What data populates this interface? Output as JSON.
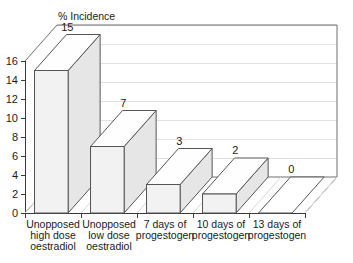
{
  "chart_data": {
    "type": "bar",
    "title": "% Incidence",
    "xlabel": "",
    "ylabel": "% Incidence",
    "ylim": [
      0,
      16
    ],
    "ytick_labels": [
      "0",
      "2",
      "4",
      "6",
      "8",
      "10",
      "12",
      "14",
      "16"
    ],
    "ytick_values": [
      0,
      2,
      4,
      6,
      8,
      10,
      12,
      14,
      16
    ],
    "grid": true,
    "legend": "none",
    "three_d": true,
    "categories": [
      "Unopposed high dose oestradiol",
      "Unopposed low dose oestradiol",
      "7 days of progestogen",
      "10 days of progestogen",
      "13 days of progestogen"
    ],
    "category_lines": [
      [
        "Unopposed",
        "high dose",
        "oestradiol"
      ],
      [
        "Unopposed",
        "low dose",
        "oestradiol"
      ],
      [
        "7 days of",
        "progestogen"
      ],
      [
        "10 days of",
        "progestogen"
      ],
      [
        "13 days of",
        "progestogen"
      ]
    ],
    "values": [
      15,
      7,
      3,
      2,
      0
    ],
    "value_labels": [
      "15",
      "7",
      "3",
      "2",
      "0"
    ],
    "colors": {
      "bar_front": "#f2f2f2",
      "bar_top": "#fefefe",
      "bar_side": "#e6e6e6",
      "bar_outline": "#555555",
      "axis": "#3a3a3a",
      "grid": "#e2e2e2",
      "background": "#ffffff",
      "text": "#1a1a1a"
    }
  }
}
